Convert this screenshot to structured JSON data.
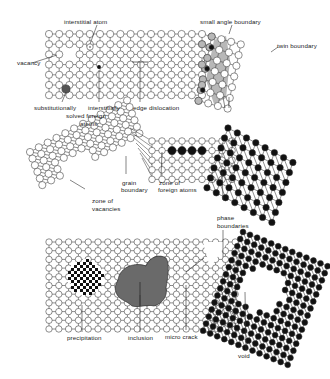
{
  "labels": {
    "interstitial_atom": "interstitial atom",
    "small_angle_boundary": "small angle boundary",
    "twin_boundary": "twin boundary",
    "vacancy": "vacancy",
    "substitutionally": "substitutionally",
    "solved_foreign": "solved foreign",
    "atoms": "atoms",
    "interstitially": "interstitially",
    "edge_dislocation": "edge dislocation",
    "grain": "grain",
    "boundary": "boundary",
    "zone_of_1": "zone of",
    "foreign_atoms": "foreign atoms",
    "zone_of_2": "zone of",
    "vacancies": "vacancies",
    "phase": "phase",
    "boundaries": "boundaries",
    "precipitation": "precipitation",
    "inclusion": "inclusion",
    "micro_crack": "micro crack",
    "void": "void"
  },
  "colors": {
    "line": "#333333",
    "atom_fill": "#ffffff",
    "foreign_atom": "#111111",
    "boundary_shade": "#b8b8b8",
    "inclusion": "#6a6a6a",
    "text": "#222222"
  },
  "panels": {
    "top": {
      "lattice": {
        "x0": 49,
        "y0": 34,
        "cols": 20,
        "rows": 7,
        "dx": 10.2,
        "dy": 10.2,
        "r": 3.6
      },
      "vacancy": {
        "col": 2,
        "row": 2
      },
      "interstitial_atom": {
        "x": 90,
        "y": 47
      },
      "substitutional": {
        "x": 66,
        "y": 89
      },
      "interstitial_foreign": {
        "x": 99,
        "y": 67
      },
      "edge_dislocation_x": 140
    },
    "middle": {
      "square": {
        "x0": 152,
        "y0": 141,
        "cols": 9,
        "rows": 5,
        "dx": 10,
        "dy": 9.6,
        "r": 3.3
      },
      "foreign_row": {
        "row": 1,
        "cols": [
          2,
          3,
          4,
          5
        ]
      },
      "tilted_left": {
        "x0": 30,
        "y0": 172,
        "angle": -28,
        "cols": 12,
        "rows": 6,
        "d": 10,
        "r": 3.6
      },
      "black_lattice": {
        "x0": 228,
        "y0": 128,
        "angle": 28,
        "cols": 8,
        "rows": 7,
        "d": 10.5,
        "r": 3.2
      }
    },
    "bottom": {
      "square": {
        "x0": 49,
        "y0": 242,
        "cols": 20,
        "rows": 11,
        "dx": 9.8,
        "dy": 8.7,
        "r": 3.2
      },
      "black_lattice": {
        "x0": 243,
        "y0": 232,
        "angle": 22,
        "cols": 13,
        "rows": 15,
        "d": 7.6,
        "r": 2.9
      },
      "void": {
        "cx": 262,
        "cy": 290,
        "r": 22
      }
    }
  }
}
